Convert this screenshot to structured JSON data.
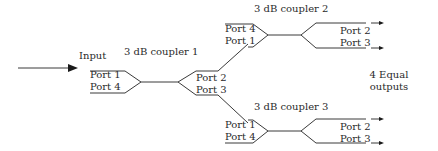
{
  "input_label": "Input",
  "outputs_label": [
    "4 Equal",
    "outputs"
  ],
  "couplers": [
    {
      "title": "3 dB coupler 1",
      "left_ports": [
        "Port 1",
        "Port 4"
      ],
      "right_ports": [
        "Port 2",
        "Port 3"
      ]
    },
    {
      "title": "3 dB coupler 2",
      "left_ports": [
        "Port 4",
        "Port 1"
      ],
      "right_ports": [
        "Port 2",
        "Port 3"
      ]
    },
    {
      "title": "3 dB coupler 3",
      "left_ports": [
        "Port 1",
        "Port 4"
      ],
      "right_ports": [
        "Port 2",
        "Port 3"
      ]
    }
  ],
  "colors": {
    "line": "#3a3a3a",
    "text": "#2a2a2a",
    "arrow": "#1a1a1a"
  }
}
